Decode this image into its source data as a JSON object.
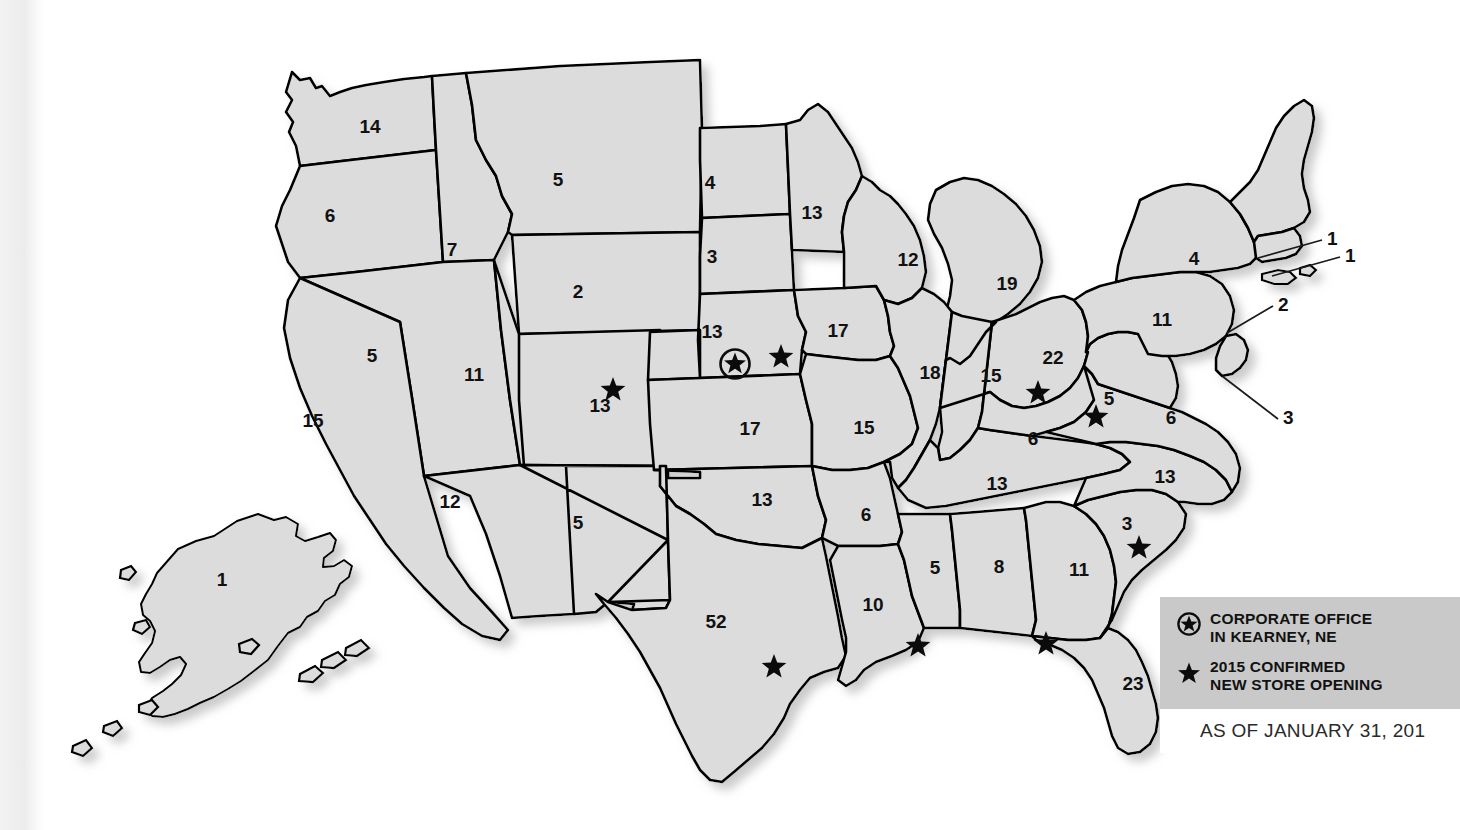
{
  "map": {
    "title": "US store count by state",
    "state_fill": "#dcdcdc",
    "border_color": "#000000",
    "states": [
      {
        "code": "AK",
        "name": "Alaska",
        "value": "1",
        "lx": 222,
        "ly": 586
      },
      {
        "code": "WA",
        "name": "Washington",
        "value": "14",
        "lx": 370,
        "ly": 133
      },
      {
        "code": "OR",
        "name": "Oregon",
        "value": "6",
        "lx": 330,
        "ly": 222
      },
      {
        "code": "ID",
        "name": "Idaho",
        "value": "7",
        "lx": 452,
        "ly": 256
      },
      {
        "code": "MT",
        "name": "Montana",
        "value": "5",
        "lx": 558,
        "ly": 186
      },
      {
        "code": "WY",
        "name": "Wyoming",
        "value": "2",
        "lx": 578,
        "ly": 298
      },
      {
        "code": "NV",
        "name": "Nevada",
        "value": "5",
        "lx": 372,
        "ly": 362
      },
      {
        "code": "UT",
        "name": "Utah",
        "value": "11",
        "lx": 474,
        "ly": 381
      },
      {
        "code": "CA",
        "name": "California",
        "value": "15",
        "lx": 313,
        "ly": 427
      },
      {
        "code": "AZ",
        "name": "Arizona",
        "value": "12",
        "lx": 450,
        "ly": 508
      },
      {
        "code": "NM",
        "name": "New Mexico",
        "value": "5",
        "lx": 578,
        "ly": 529
      },
      {
        "code": "CO",
        "name": "Colorado",
        "value": "13",
        "lx": 600,
        "ly": 412
      },
      {
        "code": "ND",
        "name": "North Dakota",
        "value": "4",
        "lx": 710,
        "ly": 189
      },
      {
        "code": "SD",
        "name": "South Dakota",
        "value": "3",
        "lx": 712,
        "ly": 263
      },
      {
        "code": "NE",
        "name": "Nebraska",
        "value": "13",
        "lx": 712,
        "ly": 338
      },
      {
        "code": "KS",
        "name": "Kansas",
        "value": "17",
        "lx": 750,
        "ly": 435
      },
      {
        "code": "OK",
        "name": "Oklahoma",
        "value": "13",
        "lx": 762,
        "ly": 506
      },
      {
        "code": "TX",
        "name": "Texas",
        "value": "52",
        "lx": 716,
        "ly": 628
      },
      {
        "code": "MN",
        "name": "Minnesota",
        "value": "13",
        "lx": 812,
        "ly": 219
      },
      {
        "code": "IA",
        "name": "Iowa",
        "value": "17",
        "lx": 838,
        "ly": 337
      },
      {
        "code": "MO",
        "name": "Missouri",
        "value": "15",
        "lx": 864,
        "ly": 434
      },
      {
        "code": "AR",
        "name": "Arkansas",
        "value": "6",
        "lx": 866,
        "ly": 521
      },
      {
        "code": "LA",
        "name": "Louisiana",
        "value": "10",
        "lx": 873,
        "ly": 611
      },
      {
        "code": "WI",
        "name": "Wisconsin",
        "value": "12",
        "lx": 908,
        "ly": 266
      },
      {
        "code": "IL",
        "name": "Illinois",
        "value": "18",
        "lx": 930,
        "ly": 379
      },
      {
        "code": "MS",
        "name": "Mississippi",
        "value": "5",
        "lx": 935,
        "ly": 574
      },
      {
        "code": "MI",
        "name": "Michigan",
        "value": "19",
        "lx": 1007,
        "ly": 290
      },
      {
        "code": "IN",
        "name": "Indiana",
        "value": "15",
        "lx": 991,
        "ly": 382
      },
      {
        "code": "KY",
        "name": "Kentucky",
        "value": "6",
        "lx": 1033,
        "ly": 445
      },
      {
        "code": "TN",
        "name": "Tennessee",
        "value": "13",
        "lx": 997,
        "ly": 490
      },
      {
        "code": "AL",
        "name": "Alabama",
        "value": "8",
        "lx": 999,
        "ly": 573
      },
      {
        "code": "GA",
        "name": "Georgia",
        "value": "11",
        "lx": 1079,
        "ly": 576
      },
      {
        "code": "FL",
        "name": "Florida",
        "value": "23",
        "lx": 1133,
        "ly": 690
      },
      {
        "code": "OH",
        "name": "Ohio",
        "value": "22",
        "lx": 1053,
        "ly": 364
      },
      {
        "code": "WV",
        "name": "West Virginia",
        "value": "5",
        "lx": 1109,
        "ly": 405
      },
      {
        "code": "PA",
        "name": "Pennsylvania",
        "value": "11",
        "lx": 1162,
        "ly": 326
      },
      {
        "code": "VA",
        "name": "Virginia",
        "value": "6",
        "lx": 1171,
        "ly": 424
      },
      {
        "code": "NC",
        "name": "North Carolina",
        "value": "13",
        "lx": 1165,
        "ly": 483
      },
      {
        "code": "SC",
        "name": "South Carolina",
        "value": "3",
        "lx": 1127,
        "ly": 530
      },
      {
        "code": "NY",
        "name": "New York",
        "value": "4",
        "lx": 1194,
        "ly": 265
      }
    ],
    "callouts": [
      {
        "name": "massachusetts-callout",
        "value": "1",
        "tx": 1327,
        "ty": 245,
        "x1": 1322,
        "y1": 240,
        "x2": 1258,
        "y2": 258
      },
      {
        "name": "rhode-island-callout",
        "value": "1",
        "tx": 1345,
        "ty": 262,
        "x1": 1340,
        "y1": 257,
        "x2": 1272,
        "y2": 276
      },
      {
        "name": "new-jersey-callout",
        "value": "2",
        "tx": 1278,
        "ty": 311,
        "x1": 1273,
        "y1": 306,
        "x2": 1227,
        "y2": 333
      },
      {
        "name": "maryland-delaware-callout",
        "value": "3",
        "tx": 1283,
        "ty": 424,
        "x1": 1278,
        "y1": 419,
        "x2": 1222,
        "y2": 376
      }
    ],
    "stars": [
      {
        "name": "star-colorado",
        "x": 613,
        "y": 390
      },
      {
        "name": "star-nebraska",
        "x": 781,
        "y": 357
      },
      {
        "name": "star-texas",
        "x": 774,
        "y": 667
      },
      {
        "name": "star-louisiana",
        "x": 918,
        "y": 646
      },
      {
        "name": "star-florida-panhandle",
        "x": 1046,
        "y": 644
      },
      {
        "name": "star-south-carolina",
        "x": 1139,
        "y": 548
      },
      {
        "name": "star-ohio",
        "x": 1038,
        "y": 393
      },
      {
        "name": "star-west-virginia",
        "x": 1096,
        "y": 417
      }
    ],
    "hq_marker": {
      "name": "corporate-office-marker",
      "x": 735,
      "y": 364,
      "label": "Kearney, NE"
    }
  },
  "legend": {
    "corporate_office": "CORPORATE OFFICE\nIN KEARNEY, NE",
    "new_store": "2015 CONFIRMED\nNEW STORE OPENING",
    "corporate_icon": "circled-star-icon",
    "store_icon": "star-icon",
    "background": "#c9c9c9"
  },
  "footer": {
    "as_of": "AS OF JANUARY 31, 201"
  }
}
